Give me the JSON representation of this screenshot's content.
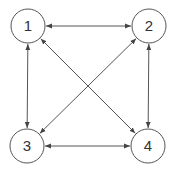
{
  "diagram": {
    "type": "graph",
    "directed": "bidirectional",
    "colors": {
      "stroke": "#555555",
      "text": "#333333",
      "background": "#ffffff"
    },
    "nodes": [
      {
        "id": "1",
        "label": "1",
        "cx": 28,
        "cy": 26,
        "r": 17
      },
      {
        "id": "2",
        "label": "2",
        "cx": 149,
        "cy": 26,
        "r": 17
      },
      {
        "id": "3",
        "label": "3",
        "cx": 27,
        "cy": 146,
        "r": 17
      },
      {
        "id": "4",
        "label": "4",
        "cx": 148,
        "cy": 146,
        "r": 17
      }
    ],
    "edges": [
      {
        "from": "1",
        "to": "2",
        "arrows": "both"
      },
      {
        "from": "1",
        "to": "3",
        "arrows": "both"
      },
      {
        "from": "1",
        "to": "4",
        "arrows": "both"
      },
      {
        "from": "2",
        "to": "3",
        "arrows": "both"
      },
      {
        "from": "2",
        "to": "4",
        "arrows": "both"
      },
      {
        "from": "3",
        "to": "4",
        "arrows": "both"
      }
    ]
  }
}
